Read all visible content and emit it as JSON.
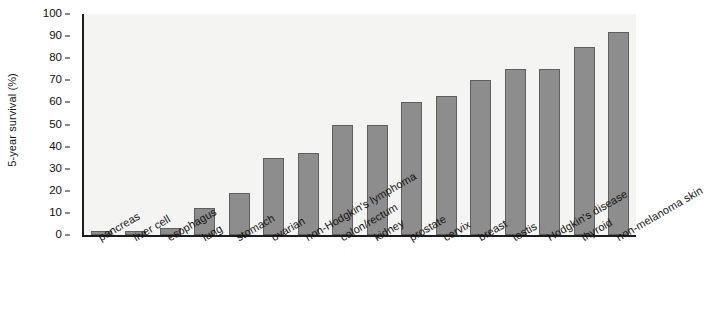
{
  "chart_data": {
    "type": "bar",
    "title": "",
    "xlabel": "",
    "ylabel": "5-year survival (%)",
    "ylim": [
      0,
      100
    ],
    "yticks": [
      0,
      10,
      20,
      30,
      40,
      50,
      60,
      70,
      80,
      90,
      100
    ],
    "grid": false,
    "legend": "none",
    "bar_color": "#8d8d8d",
    "bar_edge_color": "#5e5e5e",
    "plot_background": "#f4f4f2",
    "axis_color": "#1c1c1c",
    "categories": [
      "pancreas",
      "liver cell",
      "esophagus",
      "lung",
      "stomach",
      "ovarian",
      "non-Hodgkin's lymphoma",
      "colon/rectum",
      "kidney",
      "prostate",
      "cervix",
      "breast",
      "testis",
      "Hodgkin's disease",
      "thyroid",
      "non-melanoma skin"
    ],
    "values": [
      2,
      2,
      3,
      12,
      19,
      35,
      37,
      50,
      50,
      60,
      63,
      70,
      75,
      75,
      85,
      92
    ]
  }
}
